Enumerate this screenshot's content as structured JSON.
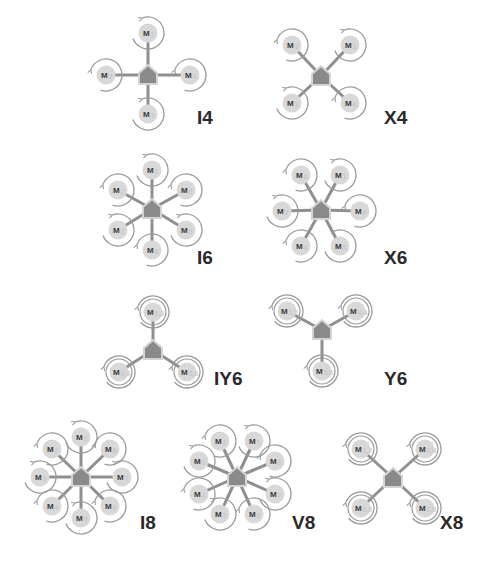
{
  "colors": {
    "arm": "#8f8f8f",
    "body": "#8a8a8a",
    "body_outline": "#d4d4d4",
    "motor_fill": "#d8d8d8",
    "ring": "#9a9a9a",
    "label": "#2a2a2a",
    "background": "#ffffff"
  },
  "frames": [
    {
      "id": "I4",
      "label": "I4",
      "center": [
        148,
        75
      ],
      "label_pos": [
        197,
        124
      ],
      "dual": false,
      "motors": [
        {
          "label": "M",
          "sub": "1",
          "pos": [
            148,
            33
          ],
          "dir": "ccw"
        },
        {
          "label": "M",
          "sub": "2",
          "pos": [
            106,
            75
          ],
          "dir": "cw"
        },
        {
          "label": "M",
          "sub": "4",
          "pos": [
            190,
            75
          ],
          "dir": "cw"
        },
        {
          "label": "M",
          "sub": "3",
          "pos": [
            148,
            114
          ],
          "dir": "ccw"
        }
      ]
    },
    {
      "id": "X4",
      "label": "X4",
      "center": [
        321,
        76
      ],
      "label_pos": [
        384,
        124
      ],
      "dual": false,
      "motors": [
        {
          "label": "M",
          "sub": "2",
          "pos": [
            292,
            45
          ],
          "dir": "cw"
        },
        {
          "label": "M",
          "sub": "1",
          "pos": [
            350,
            45
          ],
          "dir": "ccw"
        },
        {
          "label": "M",
          "sub": "3",
          "pos": [
            292,
            103
          ],
          "dir": "ccw"
        },
        {
          "label": "M",
          "sub": "4",
          "pos": [
            350,
            103
          ],
          "dir": "cw"
        }
      ]
    },
    {
      "id": "I6",
      "label": "I6",
      "center": [
        152,
        209
      ],
      "label_pos": [
        197,
        264
      ],
      "dual": false,
      "motors": [
        {
          "label": "M",
          "sub": "1",
          "pos": [
            152,
            170
          ],
          "dir": "ccw"
        },
        {
          "label": "M",
          "sub": "2",
          "pos": [
            118,
            190
          ],
          "dir": "cw"
        },
        {
          "label": "M",
          "sub": "6",
          "pos": [
            186,
            190
          ],
          "dir": "cw"
        },
        {
          "label": "M",
          "sub": "3",
          "pos": [
            118,
            230
          ],
          "dir": "ccw"
        },
        {
          "label": "M",
          "sub": "5",
          "pos": [
            186,
            230
          ],
          "dir": "ccw"
        },
        {
          "label": "M",
          "sub": "4",
          "pos": [
            152,
            250
          ],
          "dir": "cw"
        }
      ]
    },
    {
      "id": "X6",
      "label": "X6",
      "center": [
        321,
        210
      ],
      "label_pos": [
        384,
        264
      ],
      "dual": false,
      "motors": [
        {
          "label": "M",
          "sub": "2",
          "pos": [
            301,
            175
          ],
          "dir": "cw"
        },
        {
          "label": "M",
          "sub": "1",
          "pos": [
            340,
            175
          ],
          "dir": "ccw"
        },
        {
          "label": "M",
          "sub": "3",
          "pos": [
            282,
            211
          ],
          "dir": "ccw"
        },
        {
          "label": "M",
          "sub": "6",
          "pos": [
            360,
            211
          ],
          "dir": "cw"
        },
        {
          "label": "M",
          "sub": "4",
          "pos": [
            301,
            246
          ],
          "dir": "cw"
        },
        {
          "label": "M",
          "sub": "5",
          "pos": [
            340,
            246
          ],
          "dir": "ccw"
        }
      ]
    },
    {
      "id": "IY6",
      "label": "IY6",
      "center": [
        153,
        350
      ],
      "label_pos": [
        214,
        385
      ],
      "dual": true,
      "motors": [
        {
          "label": "M",
          "sub": "1,2",
          "pos": [
            153,
            312
          ],
          "dir": "cw"
        },
        {
          "label": "M",
          "sub": "3,4",
          "pos": [
            119,
            372
          ],
          "dir": "cw"
        },
        {
          "label": "M",
          "sub": "5,6",
          "pos": [
            187,
            372
          ],
          "dir": "cw"
        }
      ]
    },
    {
      "id": "Y6",
      "label": "Y6",
      "center": [
        322,
        330
      ],
      "label_pos": [
        384,
        385
      ],
      "dual": true,
      "motors": [
        {
          "label": "M",
          "sub": "1,2",
          "pos": [
            287,
            311
          ],
          "dir": "cw"
        },
        {
          "label": "M",
          "sub": "3,4",
          "pos": [
            356,
            311
          ],
          "dir": "cw"
        },
        {
          "label": "M",
          "sub": "5,6",
          "pos": [
            322,
            371
          ],
          "dir": "cw"
        }
      ]
    },
    {
      "id": "I8",
      "label": "I8",
      "center": [
        81,
        477
      ],
      "label_pos": [
        140,
        529
      ],
      "dual": false,
      "motors": [
        {
          "label": "M",
          "sub": "1",
          "pos": [
            81,
            437
          ],
          "dir": "ccw"
        },
        {
          "label": "M",
          "sub": "2",
          "pos": [
            52,
            449
          ],
          "dir": "cw"
        },
        {
          "label": "M",
          "sub": "8",
          "pos": [
            110,
            449
          ],
          "dir": "cw"
        },
        {
          "label": "M",
          "sub": "3",
          "pos": [
            40,
            477
          ],
          "dir": "ccw"
        },
        {
          "label": "M",
          "sub": "7",
          "pos": [
            122,
            477
          ],
          "dir": "ccw"
        },
        {
          "label": "M",
          "sub": "4",
          "pos": [
            52,
            506
          ],
          "dir": "cw"
        },
        {
          "label": "M",
          "sub": "6",
          "pos": [
            110,
            506
          ],
          "dir": "cw"
        },
        {
          "label": "M",
          "sub": "5",
          "pos": [
            81,
            518
          ],
          "dir": "ccw"
        }
      ]
    },
    {
      "id": "V8",
      "label": "V8",
      "center": [
        237,
        477
      ],
      "label_pos": [
        292,
        529
      ],
      "dual": false,
      "motors": [
        {
          "label": "M",
          "sub": "2",
          "pos": [
            220,
            441
          ],
          "dir": "cw"
        },
        {
          "label": "M",
          "sub": "1",
          "pos": [
            254,
            441
          ],
          "dir": "ccw"
        },
        {
          "label": "M",
          "sub": "3",
          "pos": [
            199,
            461
          ],
          "dir": "ccw"
        },
        {
          "label": "M",
          "sub": "8",
          "pos": [
            275,
            461
          ],
          "dir": "cw"
        },
        {
          "label": "M",
          "sub": "4",
          "pos": [
            199,
            494
          ],
          "dir": "cw"
        },
        {
          "label": "M",
          "sub": "7",
          "pos": [
            275,
            494
          ],
          "dir": "ccw"
        },
        {
          "label": "M",
          "sub": "5",
          "pos": [
            220,
            514
          ],
          "dir": "ccw"
        },
        {
          "label": "M",
          "sub": "6",
          "pos": [
            254,
            514
          ],
          "dir": "cw"
        }
      ]
    },
    {
      "id": "X8",
      "label": "X8",
      "center": [
        393,
        478
      ],
      "label_pos": [
        440,
        529
      ],
      "dual": true,
      "motors": [
        {
          "label": "M",
          "sub": "1,2",
          "pos": [
            361,
            449
          ],
          "dir": "cw"
        },
        {
          "label": "M",
          "sub": "3,4",
          "pos": [
            425,
            449
          ],
          "dir": "cw"
        },
        {
          "label": "M",
          "sub": "5,6",
          "pos": [
            361,
            508
          ],
          "dir": "cw"
        },
        {
          "label": "M",
          "sub": "7,8",
          "pos": [
            425,
            508
          ],
          "dir": "cw"
        }
      ]
    }
  ]
}
